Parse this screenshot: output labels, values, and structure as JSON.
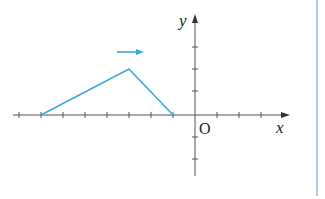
{
  "diagram": {
    "type": "coordinate-plane-graph",
    "axis_labels": {
      "x": "x",
      "y": "y",
      "origin": "O"
    },
    "grid_unit_px": 22,
    "x_ticks": [
      -8,
      -7,
      -6,
      -5,
      -4,
      -3,
      -2,
      -1,
      1,
      2,
      3
    ],
    "y_ticks": [
      -2,
      -1,
      1,
      2,
      3
    ],
    "polyline_points": [
      [
        -7,
        0
      ],
      [
        -3,
        2
      ],
      [
        -1,
        0
      ]
    ],
    "translation_arrow": {
      "direction": "right"
    },
    "colors": {
      "axes": "#555555",
      "graph": "#3aa8e0",
      "arrow": "#3aa8e0",
      "border": "#8aa8c8"
    }
  }
}
